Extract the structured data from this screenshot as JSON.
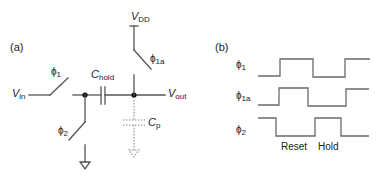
{
  "panel_a": {
    "label": "(a)",
    "vdd": {
      "main": "V",
      "sub": "DD"
    },
    "vin": {
      "main": "V",
      "sub": "in"
    },
    "vout": {
      "main": "V",
      "sub": "out"
    },
    "chold": {
      "main": "C",
      "sub": "hold"
    },
    "cp": {
      "main": "C",
      "sub": "p"
    },
    "switch_phi1": {
      "main": "ϕ",
      "sub": "1"
    },
    "switch_phi2": {
      "main": "ϕ",
      "sub": "2"
    },
    "switch_phi1a": {
      "main": "ϕ",
      "sub": "1a"
    }
  },
  "panel_b": {
    "label": "(b)",
    "signals": [
      {
        "main": "ϕ",
        "sub": "1"
      },
      {
        "main": "ϕ",
        "sub": "1a"
      },
      {
        "main": "ϕ",
        "sub": "2"
      }
    ],
    "phase_labels": [
      "Reset",
      "Hold"
    ]
  },
  "colors": {
    "wire": "#555555",
    "waveform": "#6a6a6a",
    "parasitic": "#8a8a8a",
    "text": "#222222"
  }
}
